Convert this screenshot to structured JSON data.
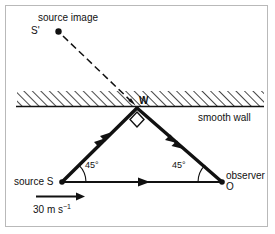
{
  "figure": {
    "type": "physics-ray-diagram",
    "labels": {
      "source_image": "source image",
      "source_image_point": "S'",
      "wall_point": "W",
      "wall": "smooth wall",
      "angle_left": "45°",
      "angle_right": "45°",
      "source": "source S",
      "observer": "observer",
      "observer_point": "O",
      "speed_value": "30 m s",
      "speed_exponent": "−1"
    },
    "colors": {
      "ink": "#111111",
      "border": "#b9b9b9",
      "background": "#ffffff",
      "hatch": "#1a1a1a"
    },
    "geometry": {
      "source_point": [
        62,
        182
      ],
      "observer_point": [
        222,
        182
      ],
      "wall_point": [
        137,
        108
      ],
      "source_image_point": [
        58,
        32
      ],
      "wall_line_y": 106,
      "hatch_band": [
        91,
        106
      ],
      "angle_left_deg": 45,
      "angle_right_deg": 45,
      "right_angle_at": "W"
    }
  }
}
